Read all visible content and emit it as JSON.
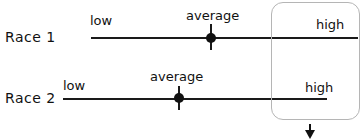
{
  "diagram": {
    "races": [
      {
        "label": "Race 1",
        "low_label": "low",
        "average_label": "average",
        "high_label": "high"
      },
      {
        "label": "Race 2",
        "low_label": "low",
        "average_label": "average",
        "high_label": "high"
      }
    ],
    "highlight_box": {
      "description": "rounded box around high ends",
      "arrow": "down-arrow"
    }
  }
}
